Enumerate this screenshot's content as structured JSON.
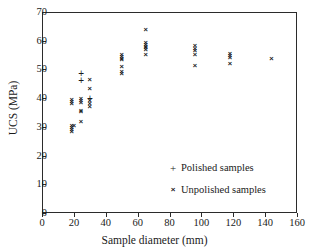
{
  "chart_data": {
    "type": "scatter",
    "title": "",
    "xlabel": "Sample diameter (mm)",
    "ylabel": "UCS (MPa)",
    "xlim": [
      0,
      160
    ],
    "ylim": [
      0,
      70
    ],
    "xticks": [
      0,
      20,
      40,
      60,
      80,
      100,
      120,
      140,
      160
    ],
    "yticks": [
      0,
      10,
      20,
      30,
      40,
      50,
      60,
      70
    ],
    "grid": false,
    "legend_position": "lower-right",
    "series": [
      {
        "name": "Polished samples",
        "marker": "+",
        "points": [
          {
            "x": 24.5,
            "y": 48.8
          },
          {
            "x": 24.5,
            "y": 46.3
          },
          {
            "x": 30.0,
            "y": 40.1
          }
        ]
      },
      {
        "name": "Unpolished samples",
        "marker": "x",
        "points": [
          {
            "x": 18.6,
            "y": 39.6
          },
          {
            "x": 18.6,
            "y": 39.0
          },
          {
            "x": 18.6,
            "y": 38.4
          },
          {
            "x": 18.6,
            "y": 30.8
          },
          {
            "x": 18.6,
            "y": 30.0
          },
          {
            "x": 18.6,
            "y": 29.2
          },
          {
            "x": 18.6,
            "y": 28.5
          },
          {
            "x": 20.0,
            "y": 30.6
          },
          {
            "x": 24.5,
            "y": 39.9
          },
          {
            "x": 24.5,
            "y": 39.3
          },
          {
            "x": 24.5,
            "y": 38.7
          },
          {
            "x": 24.5,
            "y": 36.0
          },
          {
            "x": 24.5,
            "y": 35.4
          },
          {
            "x": 24.5,
            "y": 32.0
          },
          {
            "x": 30.0,
            "y": 46.6
          },
          {
            "x": 30.0,
            "y": 43.4
          },
          {
            "x": 30.0,
            "y": 39.4
          },
          {
            "x": 30.0,
            "y": 38.2
          },
          {
            "x": 30.0,
            "y": 37.2
          },
          {
            "x": 50.0,
            "y": 55.2
          },
          {
            "x": 50.0,
            "y": 54.6
          },
          {
            "x": 50.0,
            "y": 54.0
          },
          {
            "x": 50.0,
            "y": 53.5
          },
          {
            "x": 50.0,
            "y": 51.3
          },
          {
            "x": 50.0,
            "y": 49.3
          },
          {
            "x": 50.0,
            "y": 48.8
          },
          {
            "x": 65.0,
            "y": 64.0
          },
          {
            "x": 65.0,
            "y": 59.5
          },
          {
            "x": 65.0,
            "y": 58.9
          },
          {
            "x": 65.0,
            "y": 58.3
          },
          {
            "x": 65.0,
            "y": 57.7
          },
          {
            "x": 65.0,
            "y": 57.1
          },
          {
            "x": 65.0,
            "y": 55.2
          },
          {
            "x": 96.0,
            "y": 58.6
          },
          {
            "x": 96.0,
            "y": 57.3
          },
          {
            "x": 96.0,
            "y": 56.7
          },
          {
            "x": 96.0,
            "y": 55.5
          },
          {
            "x": 96.0,
            "y": 51.5
          },
          {
            "x": 118.0,
            "y": 55.7
          },
          {
            "x": 118.0,
            "y": 55.0
          },
          {
            "x": 118.0,
            "y": 54.4
          },
          {
            "x": 118.0,
            "y": 52.4
          },
          {
            "x": 144.0,
            "y": 53.9
          }
        ]
      }
    ],
    "legend": [
      {
        "marker": "+",
        "label": "Polished samples"
      },
      {
        "marker": "×",
        "label": "Unpolished samples"
      }
    ]
  }
}
